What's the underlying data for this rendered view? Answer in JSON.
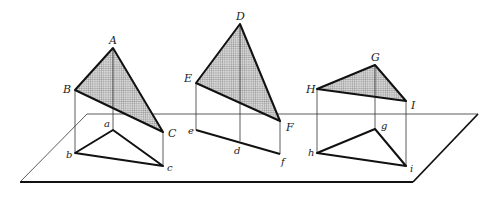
{
  "diagram": {
    "colors": {
      "line": "#111111",
      "shade": "#9a9a9a",
      "background": "#ffffff"
    },
    "plane": {
      "points": [
        [
          87,
          114
        ],
        [
          478,
          114
        ],
        [
          413,
          182
        ],
        [
          20,
          182
        ]
      ]
    },
    "triangles": [
      {
        "name": "ABC",
        "vertices": [
          {
            "label": "A",
            "x": 113,
            "y": 48
          },
          {
            "label": "B",
            "x": 75,
            "y": 90
          },
          {
            "label": "C",
            "x": 163,
            "y": 132
          }
        ],
        "projection": [
          {
            "label": "a",
            "x": 113,
            "y": 130
          },
          {
            "label": "b",
            "x": 75,
            "y": 153
          },
          {
            "label": "c",
            "x": 163,
            "y": 166
          }
        ]
      },
      {
        "name": "DEF",
        "vertices": [
          {
            "label": "D",
            "x": 240,
            "y": 24
          },
          {
            "label": "E",
            "x": 196,
            "y": 83
          },
          {
            "label": "F",
            "x": 280,
            "y": 121
          }
        ],
        "projection": [
          {
            "label": "d",
            "x": 240,
            "y": 141
          },
          {
            "label": "e",
            "x": 196,
            "y": 130
          },
          {
            "label": "f",
            "x": 280,
            "y": 154
          }
        ]
      },
      {
        "name": "GHI",
        "vertices": [
          {
            "label": "G",
            "x": 375,
            "y": 65
          },
          {
            "label": "H",
            "x": 317,
            "y": 89
          },
          {
            "label": "I",
            "x": 406,
            "y": 101
          }
        ],
        "projection": [
          {
            "label": "g",
            "x": 375,
            "y": 129
          },
          {
            "label": "h",
            "x": 317,
            "y": 153
          },
          {
            "label": "i",
            "x": 406,
            "y": 166
          }
        ]
      }
    ]
  },
  "labels": {
    "A": "A",
    "B": "B",
    "C": "C",
    "a": "a",
    "b": "b",
    "c": "c",
    "D": "D",
    "E": "E",
    "F": "F",
    "d": "d",
    "e": "e",
    "f": "f",
    "G": "G",
    "H": "H",
    "I": "I",
    "g": "g",
    "h": "h",
    "i": "i"
  }
}
